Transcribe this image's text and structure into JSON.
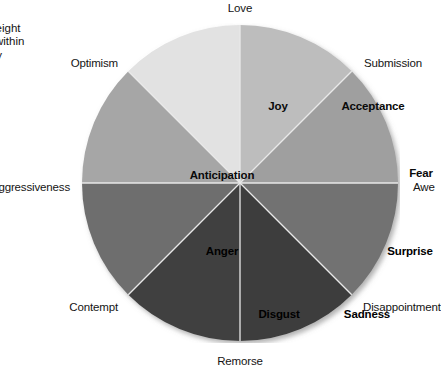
{
  "caption": {
    "title": "ns",
    "lines": [
      "e eight",
      "s within",
      "ary",
      "/"
    ]
  },
  "chart_data": {
    "type": "pie",
    "title": "",
    "subtitle": "",
    "xlabel": "",
    "ylabel": "",
    "legend_position": "none",
    "grid": false,
    "categories": [
      "Acceptance",
      "Fear",
      "Surprise",
      "Sadness",
      "Disgust",
      "Anger",
      "Anticipation",
      "Joy"
    ],
    "values": [
      12.5,
      12.5,
      12.5,
      12.5,
      12.5,
      12.5,
      12.5,
      12.5
    ],
    "slice_colors": [
      "#bdbdbd",
      "#9f9f9f",
      "#727272",
      "#3c3c3c",
      "#414141",
      "#6e6e6e",
      "#a6a6a6",
      "#e2e2e2"
    ],
    "annotations": [
      "Love",
      "Submission",
      "Awe",
      "Disappointment",
      "Remorse",
      "Contempt",
      "Aggressiveness",
      "Optimism"
    ]
  },
  "wheel": {
    "center_x": 160,
    "center_y": 160,
    "radius": 158,
    "segments": [
      {
        "id": "acceptance",
        "label": "Acceptance",
        "color": "#bdbdbd",
        "start_deg": 0,
        "end_deg": 45,
        "label_x": 293,
        "label_y": 83,
        "dark": false
      },
      {
        "id": "fear",
        "label": "Fear",
        "color": "#9f9f9f",
        "start_deg": 45,
        "end_deg": 90,
        "label_x": 341,
        "label_y": 150,
        "dark": false
      },
      {
        "id": "surprise",
        "label": "Surprise",
        "color": "#727272",
        "start_deg": 90,
        "end_deg": 135,
        "label_x": 330,
        "label_y": 228,
        "dark": true
      },
      {
        "id": "sadness",
        "label": "Sadness",
        "color": "#3c3c3c",
        "start_deg": 135,
        "end_deg": 180,
        "label_x": 287,
        "label_y": 291,
        "dark": true
      },
      {
        "id": "disgust",
        "label": "Disgust",
        "color": "#414141",
        "start_deg": 180,
        "end_deg": 225,
        "label_x": 199,
        "label_y": 291,
        "dark": true
      },
      {
        "id": "anger",
        "label": "Anger",
        "color": "#6e6e6e",
        "start_deg": 225,
        "end_deg": 270,
        "label_x": 142,
        "label_y": 228,
        "dark": true
      },
      {
        "id": "anticipation",
        "label": "Anticipation",
        "color": "#a6a6a6",
        "start_deg": 270,
        "end_deg": 315,
        "label_x": 142,
        "label_y": 152,
        "dark": false
      },
      {
        "id": "joy",
        "label": "Joy",
        "color": "#e2e2e2",
        "start_deg": 315,
        "end_deg": 360,
        "label_x": 198,
        "label_y": 83,
        "dark": false
      }
    ],
    "dyads": [
      {
        "id": "love",
        "label": "Love",
        "x": 240,
        "y": 2,
        "align": "center"
      },
      {
        "id": "submission",
        "label": "Submission",
        "x": 364,
        "y": 57,
        "align": "right"
      },
      {
        "id": "awe",
        "label": "Awe",
        "x": 413,
        "y": 181,
        "align": "right"
      },
      {
        "id": "disappointment",
        "label": "Disappointment",
        "x": 363,
        "y": 301,
        "align": "right"
      },
      {
        "id": "remorse",
        "label": "Remorse",
        "x": 240,
        "y": 355,
        "align": "center"
      },
      {
        "id": "contempt",
        "label": "Contempt",
        "x": 118,
        "y": 301,
        "align": "left"
      },
      {
        "id": "aggressiveness",
        "label": "Aggressiveness",
        "x": 70,
        "y": 181,
        "align": "left"
      },
      {
        "id": "optimism",
        "label": "Optimism",
        "x": 118,
        "y": 57,
        "align": "left"
      }
    ]
  }
}
